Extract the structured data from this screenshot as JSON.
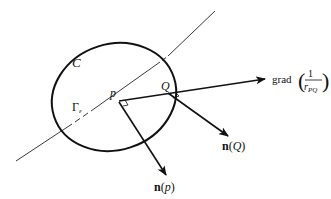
{
  "figure": {
    "type": "geometric-diagram",
    "labels": {
      "curve": "C",
      "region_symbol": "Γ",
      "region_subscript": "ε",
      "point_p": "p",
      "point_q": "Q",
      "grad_prefix": "grad",
      "grad_numerator": "1",
      "grad_denominator_r": "r",
      "grad_denominator_sub": "PQ",
      "normal_q_bold": "n",
      "normal_q_arg": "Q",
      "normal_p_bold": "n",
      "normal_p_arg": "p"
    },
    "elements": [
      {
        "name": "closed-curve-C",
        "kind": "ellipse"
      },
      {
        "name": "surface-trace",
        "kind": "line",
        "style": "thin, partly dashed inside C"
      },
      {
        "name": "vector-grad",
        "from": "p",
        "to": "grad(1/r_PQ)",
        "arrow": true
      },
      {
        "name": "vector-n-p",
        "from": "p",
        "to": "n(p)",
        "arrow": true
      },
      {
        "name": "vector-n-q",
        "from": "Q",
        "to": "n(Q)",
        "arrow": true
      }
    ],
    "colors": {
      "stroke": "#111111",
      "background": "#ffffff"
    }
  }
}
